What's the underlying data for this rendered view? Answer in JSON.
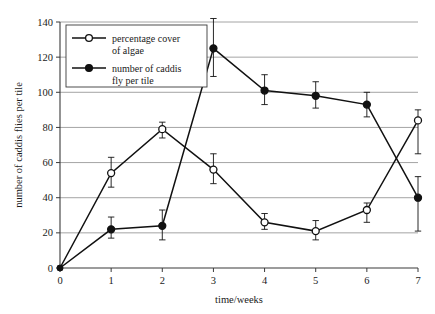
{
  "chart_data": {
    "type": "line",
    "title": "",
    "xlabel": "time/weeks",
    "ylabel": "number of caddis flies per tile",
    "xlim": [
      0,
      7
    ],
    "ylim": [
      0,
      140
    ],
    "x": [
      0,
      1,
      2,
      3,
      4,
      5,
      6,
      7
    ],
    "xticks": [
      "0",
      "1",
      "2",
      "3",
      "4",
      "5",
      "6",
      "7"
    ],
    "yticks": [
      "0",
      "20",
      "40",
      "60",
      "80",
      "100",
      "120",
      "140"
    ],
    "grid": "horizontal",
    "legend_position": "top-left",
    "series": [
      {
        "name": "percentage cover of algae",
        "marker": "open-circle",
        "values": [
          0,
          54,
          79,
          56,
          26,
          21,
          33,
          84
        ],
        "err_low": [
          0,
          8,
          5,
          8,
          4,
          5,
          7,
          19
        ],
        "err_high": [
          0,
          9,
          4,
          9,
          5,
          6,
          4,
          6
        ]
      },
      {
        "name": "number of caddis fly per tile",
        "marker": "filled-circle",
        "values": [
          0,
          22,
          24,
          125,
          101,
          98,
          93,
          40
        ],
        "err_low": [
          0,
          5,
          8,
          16,
          8,
          7,
          7,
          19
        ],
        "err_high": [
          0,
          7,
          9,
          17,
          9,
          8,
          7,
          12
        ]
      }
    ]
  },
  "legend": {
    "entries": [
      {
        "label_line1": "percentage cover",
        "label_line2": "of algae"
      },
      {
        "label_line1": "number of caddis",
        "label_line2": "fly per tile"
      }
    ]
  },
  "axes": {
    "x_title": "time/weeks",
    "y_title": "number of caddis flies per tile"
  },
  "colors": {
    "line": "#111111",
    "grid": "#8d8d8d",
    "axis": "#3a3a3a",
    "background": "#ffffff"
  }
}
